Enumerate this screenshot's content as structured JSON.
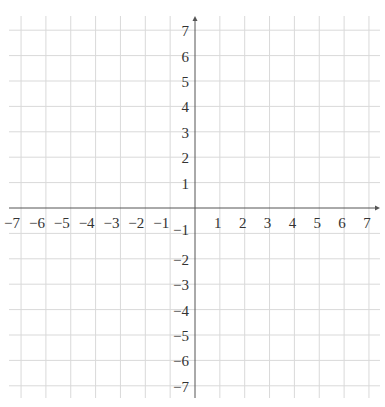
{
  "chart_data": {
    "type": "coordinate-grid",
    "title": "",
    "xlabel": "",
    "ylabel": "",
    "xlim": [
      -7,
      7
    ],
    "ylim": [
      -7,
      7
    ],
    "grid": true,
    "x_tick_labels": [
      "−7",
      "−6",
      "−5",
      "−4",
      "−3",
      "−2",
      "−1",
      "1",
      "2",
      "3",
      "4",
      "5",
      "6",
      "7"
    ],
    "y_tick_labels": [
      "7",
      "6",
      "5",
      "4",
      "3",
      "2",
      "1",
      "−1",
      "−2",
      "−3",
      "−4",
      "−5",
      "−6",
      "−7"
    ],
    "x_ticks": [
      -7,
      -6,
      -5,
      -4,
      -3,
      -2,
      -1,
      1,
      2,
      3,
      4,
      5,
      6,
      7
    ],
    "y_ticks": [
      7,
      6,
      5,
      4,
      3,
      2,
      1,
      -1,
      -2,
      -3,
      -4,
      -5,
      -6,
      -7
    ],
    "series": []
  },
  "colors": {
    "grid": "#d9d9d9",
    "axis": "#555555",
    "label": "#333333"
  }
}
